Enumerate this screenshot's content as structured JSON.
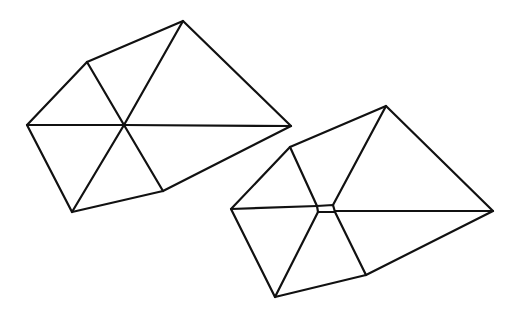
{
  "diagram": {
    "stroke_color": "#111111",
    "stroke_width": 2.2,
    "background": "#ffffff",
    "shapes": [
      {
        "id": "polygon-left",
        "outline": [
          [
            27,
            125
          ],
          [
            87,
            62
          ],
          [
            183,
            21
          ],
          [
            291,
            126
          ],
          [
            163,
            191
          ],
          [
            72,
            212
          ]
        ],
        "edges": [
          [
            [
              27,
              125
            ],
            [
              124,
              125
            ]
          ],
          [
            [
              124,
              125
            ],
            [
              291,
              126
            ]
          ],
          [
            [
              87,
              62
            ],
            [
              124,
              125
            ]
          ],
          [
            [
              183,
              21
            ],
            [
              124,
              125
            ]
          ],
          [
            [
              124,
              125
            ],
            [
              163,
              191
            ]
          ],
          [
            [
              124,
              125
            ],
            [
              72,
              212
            ]
          ]
        ]
      },
      {
        "id": "polygon-right",
        "outline": [
          [
            231,
            209
          ],
          [
            290,
            147
          ],
          [
            386,
            106
          ],
          [
            493,
            211
          ],
          [
            366,
            275
          ],
          [
            275,
            297
          ]
        ],
        "center_quad": [
          [
            317,
            206
          ],
          [
            333,
            205
          ],
          [
            335,
            212
          ],
          [
            318,
            212
          ]
        ],
        "edges": [
          [
            [
              231,
              209
            ],
            [
              317,
              206
            ]
          ],
          [
            [
              335,
              211
            ],
            [
              493,
              211
            ]
          ],
          [
            [
              290,
              147
            ],
            [
              317,
              206
            ]
          ],
          [
            [
              386,
              106
            ],
            [
              333,
              205
            ]
          ],
          [
            [
              335,
              212
            ],
            [
              366,
              275
            ]
          ],
          [
            [
              318,
              212
            ],
            [
              275,
              297
            ]
          ]
        ]
      }
    ]
  }
}
